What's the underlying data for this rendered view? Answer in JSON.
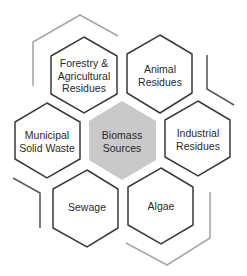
{
  "diagram": {
    "title": "Biomass Sources",
    "colors": {
      "hex_stroke": "#3a3a3a",
      "center_fill": "#c9c9c9",
      "text": "#2a2a2a",
      "deco_light": "#a8a8a8",
      "deco_dark": "#5a5a5a"
    },
    "center": {
      "label_line1": "Biomass",
      "label_line2": "Sources"
    },
    "nodes": [
      {
        "id": "forestry",
        "lines": [
          "Forestry &",
          "Agricultural",
          "Residues"
        ]
      },
      {
        "id": "animal",
        "lines": [
          "Animal",
          "Residues"
        ]
      },
      {
        "id": "municipal",
        "lines": [
          "Municipal",
          "Solid Waste"
        ]
      },
      {
        "id": "industrial",
        "lines": [
          "Industrial",
          "Residues"
        ]
      },
      {
        "id": "sewage",
        "lines": [
          "Sewage"
        ]
      },
      {
        "id": "algae",
        "lines": [
          "Algae"
        ]
      }
    ]
  }
}
